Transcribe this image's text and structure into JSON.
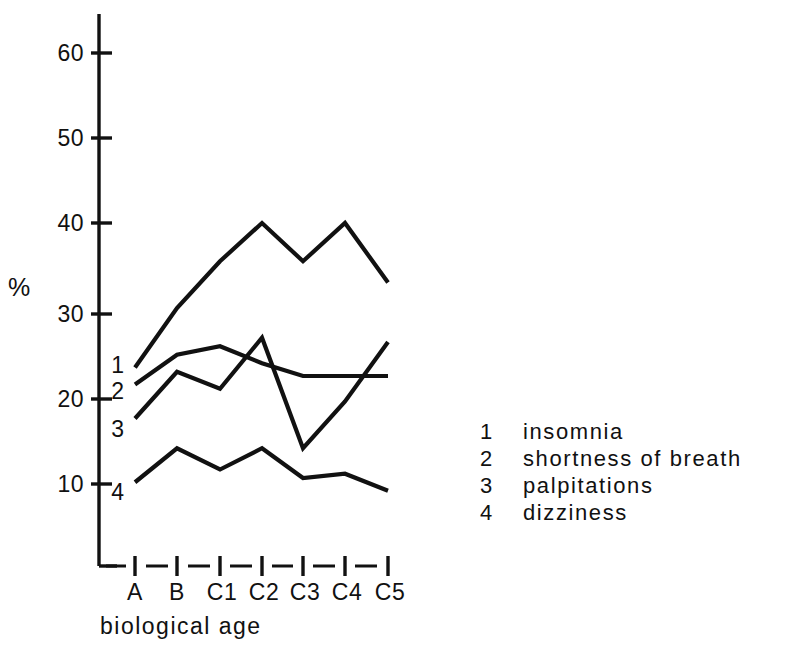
{
  "chart_data": {
    "type": "line",
    "title": "",
    "subtitle": "",
    "xlabel": "biological age",
    "ylabel": "%",
    "categories": [
      "A",
      "B",
      "C1",
      "C2",
      "C3",
      "C4",
      "C5"
    ],
    "ylim": [
      0,
      65
    ],
    "y_ticks": [
      10,
      20,
      30,
      40,
      50,
      60
    ],
    "y_tick_labels": [
      "10",
      "20",
      "30",
      "40",
      "50",
      "60"
    ],
    "grid": false,
    "legend_position": "right",
    "series": [
      {
        "name": "insomnia",
        "key": "1",
        "values": [
          23,
          30,
          35.5,
          40,
          35.5,
          40,
          33
        ]
      },
      {
        "name": "shortness of breath",
        "key": "2",
        "values": [
          21,
          24.5,
          25.5,
          23.5,
          22,
          22,
          22
        ]
      },
      {
        "name": "palpitations",
        "key": "3",
        "values": [
          17,
          22.5,
          20.5,
          26.5,
          13.5,
          19,
          26
        ]
      },
      {
        "name": "dizziness",
        "key": "4",
        "values": [
          9.5,
          13.5,
          11,
          13.5,
          10,
          10.5,
          8.5
        ]
      }
    ],
    "series_start_tags": [
      "1",
      "2",
      "3",
      "4"
    ],
    "legend": [
      {
        "num": "1",
        "label": "insomnia"
      },
      {
        "num": "2",
        "label": "shortness of breath"
      },
      {
        "num": "3",
        "label": "palpitations"
      },
      {
        "num": "4",
        "label": "dizziness"
      }
    ],
    "colors": {
      "ink": "#111111",
      "background": "#ffffff"
    }
  }
}
